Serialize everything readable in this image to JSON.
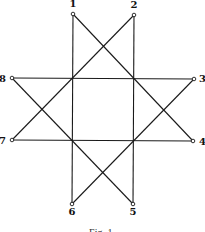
{
  "figure": {
    "caption": "Fig. 1.",
    "nodes": [
      {
        "id": "1",
        "label": "1",
        "x": 73,
        "y": 14,
        "lx": 73,
        "ly": 7,
        "anchor": "middle"
      },
      {
        "id": "2",
        "label": "2",
        "x": 134,
        "y": 15,
        "lx": 134,
        "ly": 8,
        "anchor": "middle"
      },
      {
        "id": "3",
        "label": "3",
        "x": 194,
        "y": 79,
        "lx": 199,
        "ly": 82,
        "anchor": "start"
      },
      {
        "id": "4",
        "label": "4",
        "x": 193,
        "y": 141,
        "lx": 199,
        "ly": 145,
        "anchor": "start"
      },
      {
        "id": "5",
        "label": "5",
        "x": 133,
        "y": 204,
        "lx": 133,
        "ly": 215,
        "anchor": "middle"
      },
      {
        "id": "6",
        "label": "6",
        "x": 72,
        "y": 204,
        "lx": 72,
        "ly": 215,
        "anchor": "middle"
      },
      {
        "id": "7",
        "label": "7",
        "x": 12,
        "y": 140,
        "lx": 6,
        "ly": 144,
        "anchor": "end"
      },
      {
        "id": "8",
        "label": "8",
        "x": 12,
        "y": 78,
        "lx": 6,
        "ly": 82,
        "anchor": "end"
      }
    ],
    "edges": [
      [
        "1",
        "6"
      ],
      [
        "2",
        "5"
      ],
      [
        "8",
        "3"
      ],
      [
        "7",
        "4"
      ],
      [
        "1",
        "4"
      ],
      [
        "2",
        "7"
      ],
      [
        "8",
        "5"
      ],
      [
        "3",
        "6"
      ]
    ]
  }
}
